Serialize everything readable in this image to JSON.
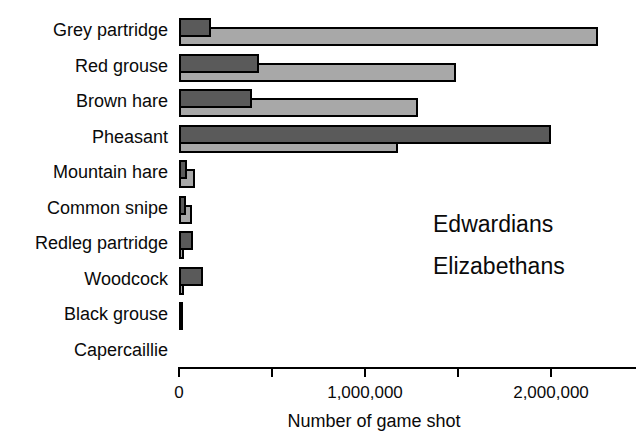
{
  "chart_data": {
    "type": "bar",
    "orientation": "horizontal",
    "bar_style": "overlapping-pairs-dark-on-top",
    "title": "",
    "xlabel": "Number of game shot",
    "ylabel": "",
    "categories": [
      "Grey partridge",
      "Red grouse",
      "Brown hare",
      "Pheasant",
      "Mountain hare",
      "Common snipe",
      "Redleg partridge",
      "Woodcock",
      "Black grouse",
      "Capercaillie"
    ],
    "series": [
      {
        "name": "Edwardians",
        "color": "#a8a8a8",
        "values": [
          2250000,
          1490000,
          1285000,
          1180000,
          85000,
          70000,
          25000,
          25000,
          12000,
          0
        ]
      },
      {
        "name": "Elizabethans",
        "color": "#5a5a5a",
        "values": [
          170000,
          430000,
          390000,
          2000000,
          45000,
          35000,
          75000,
          130000,
          20000,
          0
        ]
      }
    ],
    "xlim": [
      0,
      2460000
    ],
    "xticks": [
      {
        "value": 0,
        "label": "0"
      },
      {
        "value": 500000,
        "label": ""
      },
      {
        "value": 1000000,
        "label": "1,000,000"
      },
      {
        "value": 1500000,
        "label": ""
      },
      {
        "value": 2000000,
        "label": "2,000,000"
      }
    ],
    "grid": false,
    "legend_position": "right-middle",
    "bar_border_color": "#000000",
    "background": "#ffffff"
  },
  "legend": {
    "items": [
      "Edwardians",
      "Elizabethans"
    ]
  }
}
